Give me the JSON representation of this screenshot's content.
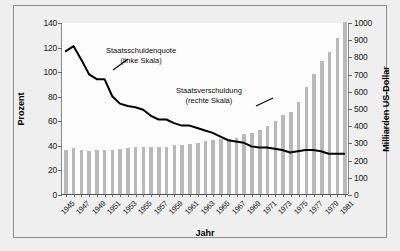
{
  "chart_data": {
    "type": "bar",
    "title": "",
    "xlabel": "Jahr",
    "ylabel": "Prozent",
    "ylabel_right": "Milliarden US-Dollar",
    "ylim": [
      0,
      140
    ],
    "ylim_right": [
      0,
      1000
    ],
    "yticks": [
      0,
      20,
      40,
      60,
      80,
      100,
      120,
      140
    ],
    "yticks_right": [
      0,
      100,
      200,
      300,
      400,
      500,
      600,
      700,
      800,
      900,
      1000
    ],
    "grid": false,
    "legend_position": "annotations-inline",
    "categories": [
      "1945",
      "1946",
      "1947",
      "1948",
      "1949",
      "1950",
      "1951",
      "1952",
      "1953",
      "1954",
      "1955",
      "1956",
      "1957",
      "1958",
      "1959",
      "1960",
      "1961",
      "1962",
      "1963",
      "1964",
      "1965",
      "1966",
      "1967",
      "1968",
      "1969",
      "1970",
      "1971",
      "1972",
      "1973",
      "1974",
      "1975",
      "1976",
      "1977",
      "1978",
      "1979",
      "1980",
      "1981"
    ],
    "xtick_labels": [
      "1945",
      "1947",
      "1949",
      "1951",
      "1953",
      "1955",
      "1957",
      "1959",
      "1961",
      "1963",
      "1965",
      "1967",
      "1969",
      "1971",
      "1973",
      "1975",
      "1977",
      "1979",
      "1981"
    ],
    "series": [
      {
        "name": "Staatsverschuldung (rechte Skala)",
        "type": "bar",
        "axis": "right",
        "unit": "Milliarden US-Dollar",
        "color": "#b9b9b9",
        "values": [
          258,
          269,
          258,
          252,
          253,
          257,
          255,
          259,
          266,
          271,
          274,
          273,
          271,
          276,
          285,
          287,
          289,
          298,
          306,
          312,
          317,
          320,
          326,
          348,
          354,
          371,
          398,
          427,
          458,
          475,
          533,
          620,
          699,
          772,
          827,
          908,
          998
        ]
      },
      {
        "name": "Staatsschuldenquote (linke Skala)",
        "type": "line",
        "axis": "left",
        "unit": "Prozent",
        "color": "#000000",
        "values": [
          117,
          121,
          110,
          98,
          94,
          94,
          80,
          74,
          72,
          71,
          69,
          64,
          61,
          61,
          58,
          56,
          56,
          54,
          52,
          50,
          47,
          44,
          43,
          42,
          39,
          38,
          38,
          37,
          36,
          34,
          35,
          36,
          36,
          35,
          33,
          33,
          33
        ]
      }
    ],
    "annotations": [
      {
        "id": "quote",
        "line1": "Staatsschuldenquote",
        "line2": "(linke Skala)"
      },
      {
        "id": "schuld",
        "line1": "Staatsverschuldung",
        "line2": "(rechte Skala)"
      }
    ]
  }
}
